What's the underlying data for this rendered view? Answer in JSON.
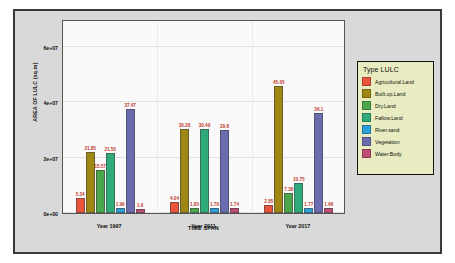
{
  "chart_data": {
    "type": "bar",
    "title": "",
    "xlabel": "TIME SPAN",
    "ylabel": "AREA OF LULC (sq.m)",
    "categories": [
      "Year 1997",
      "Year 2011",
      "Year 2017"
    ],
    "ytick_labels": [
      "0e+00",
      "2e+07",
      "4e+07",
      "6e+07"
    ],
    "ytick_values": [
      0,
      20000000,
      40000000,
      60000000
    ],
    "ylim": [
      0,
      70000000
    ],
    "grid": true,
    "legend_position": "right",
    "legend_title": "Type LULC",
    "series": [
      {
        "name": "Agricultural.Land",
        "color": "#e8553c",
        "values": [
          5340000,
          4040000,
          2850000
        ],
        "labels": [
          "5.34",
          "4.04",
          "2.85"
        ]
      },
      {
        "name": "Built.up.Land",
        "color": "#a08713",
        "values": [
          21850000,
          30280000,
          45650000
        ],
        "labels": [
          "21.85",
          "30.28",
          "45.65"
        ]
      },
      {
        "name": "Dry.Land",
        "color": "#4ca64c",
        "values": [
          15570000,
          1850000,
          7380000
        ],
        "labels": [
          "15.57",
          "1.85",
          "7.38"
        ]
      },
      {
        "name": "Fallow.Land",
        "color": "#2faa79",
        "values": [
          21500000,
          30490000,
          10750000
        ],
        "labels": [
          "21.50",
          "30.49",
          "10.75"
        ]
      },
      {
        "name": "River.sand",
        "color": "#2e9fd8",
        "values": [
          1960000,
          1760000,
          1770000
        ],
        "labels": [
          "1.96",
          "1.76",
          "1.77"
        ]
      },
      {
        "name": "Vegetation",
        "color": "#6b6bb0",
        "values": [
          37470000,
          29800000,
          36100000
        ],
        "labels": [
          "37.47",
          "29.8",
          "36.1"
        ]
      },
      {
        "name": "Water.Body",
        "color": "#bf4d74",
        "values": [
          1600000,
          1740000,
          1660000
        ],
        "labels": [
          "1.6",
          "1.74",
          "1.66"
        ]
      }
    ]
  }
}
